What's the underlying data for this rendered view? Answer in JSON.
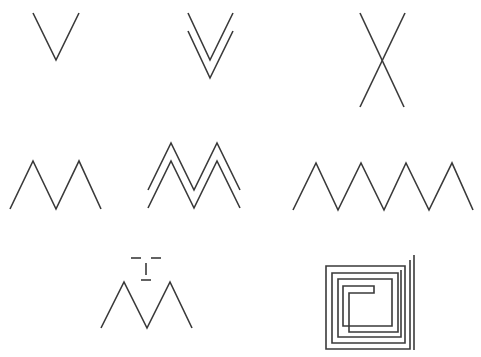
{
  "diagram": {
    "stroke_color": "#3a3a3a",
    "background": "#ffffff",
    "figures": [
      {
        "id": "single-v",
        "label": "Single V",
        "paths": [
          "33,13 56,60 79,13"
        ]
      },
      {
        "id": "double-v",
        "label": "Double V (parallel chevrons)",
        "paths": [
          "188,13 210,60 233,13",
          "188,31 210,78 233,31"
        ]
      },
      {
        "id": "x-cross",
        "label": "X cross",
        "paths": [
          "360,13 404,107",
          "405,13 360,107"
        ]
      },
      {
        "id": "single-m",
        "label": "Single M zigzag",
        "paths": [
          "10,209 33,161 56,209 79,161 101,209"
        ]
      },
      {
        "id": "double-m",
        "label": "Double M (parallel zigzags)",
        "paths": [
          "148,190 171,143 194,190 217,143 240,190",
          "148,208 171,161 194,208 217,161 240,208"
        ]
      },
      {
        "id": "long-zigzag",
        "label": "Long zigzag (four peaks)",
        "paths": [
          "293,210 316,163 338,210 361,163 384,210 406,163 429,210 452,163 473,210"
        ]
      },
      {
        "id": "m-with-glyph",
        "label": "M with T-shaped glyph above",
        "paths": [
          "101,328 124,282 147,328 170,282 192,328",
          "131,258 141,258",
          "151,258 161,258",
          "146,263 146,275",
          "141,280 151,280"
        ]
      },
      {
        "id": "square-spiral",
        "label": "Square spiral",
        "paths": [
          "414,255 414,350",
          "410,260 410,349 326,349 326,266 405,266 405,343 332,343 332,273 398,273 398,332 349,332 349,293 374,293 374,286 343,286 343,326 392,326 392,279 338,279 338,337 401,337 401,270"
        ]
      }
    ]
  }
}
